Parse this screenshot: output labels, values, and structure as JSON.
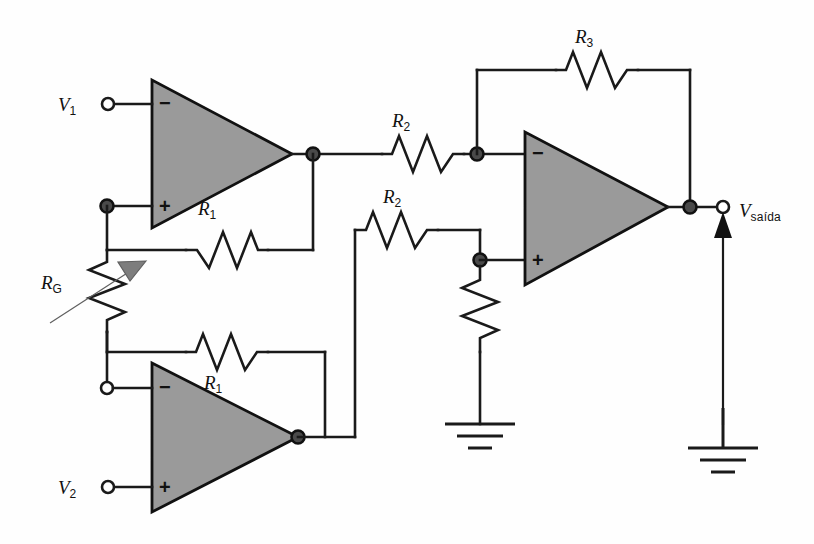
{
  "figure": {
    "type": "schematic",
    "name": "instrumentation-amplifier",
    "background": "#ffffff",
    "colors": {
      "wire": "#1a1a1a",
      "opamp_fill": "#9a9a9a",
      "opamp_stroke": "#111111",
      "pot_arrow": "#7d7d7d",
      "node_open_fill": "#ffffff",
      "node_filled_fill": "#4a4a4a"
    }
  },
  "labels": {
    "v1": {
      "base": "V",
      "sub": "1"
    },
    "v2": {
      "base": "V",
      "sub": "2"
    },
    "vout": {
      "base": "V",
      "sub": "saída"
    },
    "r1_top": {
      "base": "R",
      "sub": "1"
    },
    "r1_bottom": {
      "base": "R",
      "sub": "1"
    },
    "r2_top": {
      "base": "R",
      "sub": "2"
    },
    "r2_bottom": {
      "base": "R",
      "sub": "2"
    },
    "r3": {
      "base": "R",
      "sub": "3"
    },
    "rg": {
      "base": "R",
      "sub": "G"
    }
  },
  "opamps": [
    {
      "id": "a1",
      "name": "opamp-top-left",
      "minus": "−",
      "plus": "+"
    },
    {
      "id": "a2",
      "name": "opamp-bottom-left",
      "minus": "−",
      "plus": "+"
    },
    {
      "id": "a3",
      "name": "opamp-right",
      "minus": "−",
      "plus": "+"
    }
  ],
  "terminals": [
    {
      "name": "v1-terminal",
      "style": "open"
    },
    {
      "name": "v2-terminal",
      "style": "open"
    },
    {
      "name": "vout-terminal",
      "style": "open"
    }
  ],
  "grounds": [
    {
      "name": "ground-mid"
    },
    {
      "name": "ground-output"
    }
  ],
  "signs": {
    "minus": "−",
    "plus": "+"
  }
}
